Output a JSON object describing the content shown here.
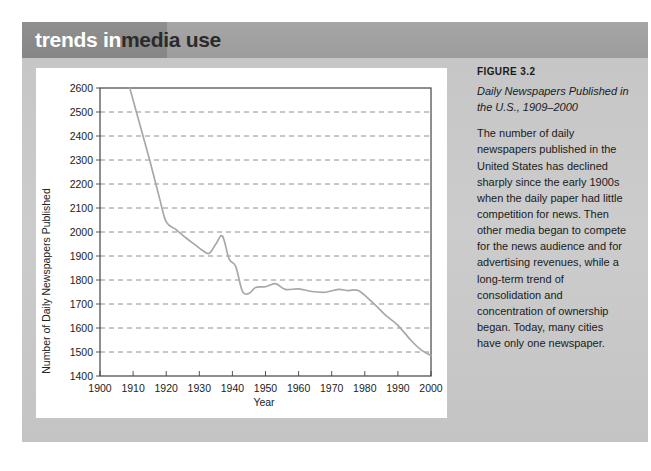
{
  "header": {
    "title_part_1": "trends in",
    "title_part_2": "media use",
    "band_color": "#9f9f9f",
    "accent_color": "#8a8a8a"
  },
  "caption": {
    "figure_number": "FIGURE 3.2",
    "figure_title": "Daily Newspapers Published in the U.S., 1909–2000",
    "description": "The number of daily newspapers published in the United States has declined sharply since the early 1900s when the daily paper had little competition for news. Then other media began to compete for the news audience and for advertising revenues, while a long-term trend of consolidation and concentration of ownership began. Today, many cities have only one newspaper."
  },
  "chart_data": {
    "type": "line",
    "title": "",
    "xlabel": "Year",
    "ylabel": "Number of Daily Newspapers Published",
    "xlim": [
      1900,
      2000
    ],
    "ylim": [
      1400,
      2600
    ],
    "xticks": [
      1900,
      1910,
      1920,
      1930,
      1940,
      1950,
      1960,
      1970,
      1980,
      1990,
      2000
    ],
    "yticks": [
      1400,
      1500,
      1600,
      1700,
      1800,
      1900,
      2000,
      2100,
      2200,
      2300,
      2400,
      2500,
      2600
    ],
    "grid": "horizontal-dashed",
    "legend": "none",
    "line_color": "#a8a8a8",
    "series": [
      {
        "name": "Daily newspapers published",
        "x": [
          1909,
          1912,
          1915,
          1918,
          1920,
          1923,
          1926,
          1929,
          1931,
          1933,
          1935,
          1937,
          1939,
          1941,
          1943,
          1945,
          1947,
          1950,
          1953,
          1956,
          1960,
          1964,
          1968,
          1972,
          1975,
          1978,
          1982,
          1986,
          1990,
          1994,
          1997,
          2000
        ],
        "y": [
          2600,
          2450,
          2300,
          2140,
          2042,
          2010,
          1975,
          1944,
          1923,
          1911,
          1950,
          1983,
          1888,
          1857,
          1754,
          1744,
          1769,
          1772,
          1785,
          1761,
          1763,
          1752,
          1749,
          1761,
          1756,
          1756,
          1711,
          1657,
          1611,
          1548,
          1509,
          1485
        ]
      }
    ]
  },
  "axis_ticks": {
    "x_labels": [
      "1900",
      "1910",
      "1920",
      "1930",
      "1940",
      "1950",
      "1960",
      "1970",
      "1980",
      "1990",
      "2000"
    ],
    "y_labels": [
      "2600",
      "2500",
      "2400",
      "2300",
      "2200",
      "2100",
      "2000",
      "1900",
      "1800",
      "1700",
      "1600",
      "1500",
      "1400"
    ]
  }
}
